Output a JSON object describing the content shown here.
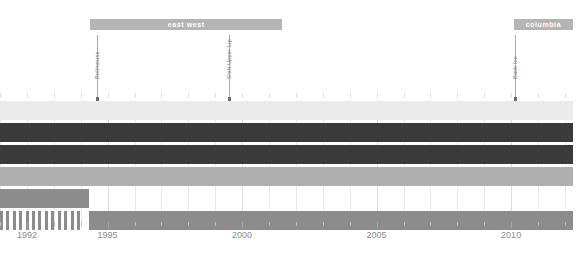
{
  "chart_data": {
    "type": "bar",
    "title": "",
    "subtitle": "",
    "xlabel": "",
    "ylabel": "",
    "xlim": [
      1991.0,
      2012.3
    ],
    "grid": true,
    "legend_position": "none",
    "x_ticks": [
      1991,
      1992,
      1993,
      1994,
      1995,
      1996,
      1997,
      1998,
      1999,
      2000,
      2001,
      2002,
      2003,
      2004,
      2005,
      2006,
      2007,
      2008,
      2009,
      2010,
      2011,
      2012
    ],
    "x_tick_labels": [
      {
        "value": 1992,
        "label": "1992"
      },
      {
        "value": 1995,
        "label": "1995"
      },
      {
        "value": 2000,
        "label": "2000"
      },
      {
        "value": 2005,
        "label": "2005"
      },
      {
        "value": 2010,
        "label": "2010"
      }
    ],
    "series": [
      {
        "name": "row-1",
        "color": "#ebebeb",
        "segments": [
          {
            "start": 1991.0,
            "end": 2012.3
          }
        ]
      },
      {
        "name": "row-2",
        "color": "#3a3a3a",
        "segments": [
          {
            "start": 1991.0,
            "end": 2012.3
          }
        ]
      },
      {
        "name": "row-3",
        "color": "#3a3a3a",
        "segments": [
          {
            "start": 1991.0,
            "end": 2012.3
          }
        ]
      },
      {
        "name": "row-4",
        "color": "#b0b0b0",
        "segments": [
          {
            "start": 1991.0,
            "end": 2012.3
          }
        ]
      },
      {
        "name": "row-5",
        "color": "#8c8c8c",
        "segments": [
          {
            "start": 1991.0,
            "end": 1994.3
          }
        ]
      },
      {
        "name": "row-6",
        "color": "#8c8c8c",
        "segments": [
          {
            "start": 1994.3,
            "end": 2012.3
          }
        ],
        "stripes": {
          "start": 1991.0,
          "end": 1994.1,
          "count": 13
        }
      }
    ],
    "group_bands": [
      {
        "label": "east west",
        "start": 1994.35,
        "end": 2001.5,
        "color": "#b4b4b4"
      },
      {
        "label": "columbia",
        "start": 2010.1,
        "end": 2012.3,
        "color": "#b4b4b4"
      }
    ],
    "events": [
      {
        "label": "Bellmouse",
        "value": 1994.6
      },
      {
        "label": "Shift Upper Lip",
        "value": 1999.5
      },
      {
        "label": "Back Ice",
        "value": 2010.15
      }
    ]
  },
  "colors": {
    "band": "#b4b4b4",
    "band_text": "#ffffff",
    "row_light": "#ebebeb",
    "row_dark": "#3a3a3a",
    "row_mid": "#b0b0b0",
    "row_gray": "#8c8c8c",
    "grid": "#e9e9e9",
    "axis_text": "#8a8a8a",
    "event_line": "#a9a9a9",
    "event_text": "#7d7d7d",
    "background": "#ffffff"
  }
}
